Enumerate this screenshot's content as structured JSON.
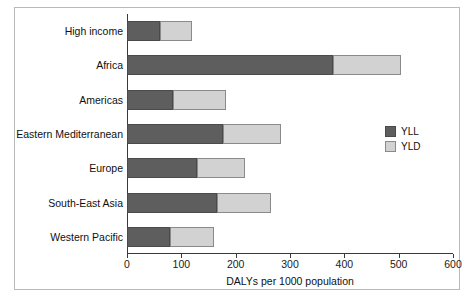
{
  "chart_data": {
    "type": "bar",
    "orientation": "horizontal",
    "stacked": true,
    "title": "",
    "xlabel": "DALYs per 1000 population",
    "ylabel": "",
    "xlim": [
      0,
      600
    ],
    "xticks": [
      0,
      100,
      200,
      300,
      400,
      500,
      600
    ],
    "xtick_labels": [
      "0",
      "100",
      "200",
      "300",
      "400",
      "500",
      "600"
    ],
    "grid": false,
    "legend_position": "right",
    "categories": [
      "High income",
      "Africa",
      "Americas",
      "Eastern Mediterranean",
      "Europe",
      "South-East Asia",
      "Western Pacific"
    ],
    "series": [
      {
        "name": "YLL",
        "color": "#5e5e5e",
        "values": [
          60,
          380,
          85,
          176,
          128,
          165,
          80
        ]
      },
      {
        "name": "YLD",
        "color": "#d2d2d2",
        "values": [
          60,
          125,
          98,
          107,
          89,
          100,
          80
        ]
      }
    ],
    "totals": [
      120,
      505,
      183,
      283,
      217,
      265,
      160
    ]
  },
  "legend": {
    "items": [
      {
        "label": "YLL",
        "color": "#5e5e5e"
      },
      {
        "label": "YLD",
        "color": "#d2d2d2"
      }
    ]
  }
}
